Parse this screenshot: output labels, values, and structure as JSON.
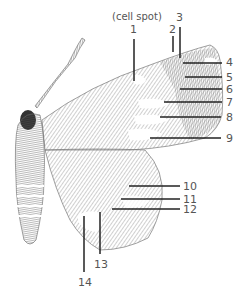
{
  "diagram": {
    "header_note": "(cell spot)",
    "labels": [
      {
        "id": "1",
        "text": "1"
      },
      {
        "id": "2",
        "text": "2"
      },
      {
        "id": "3",
        "text": "3"
      },
      {
        "id": "4",
        "text": "4"
      },
      {
        "id": "5",
        "text": "5"
      },
      {
        "id": "6",
        "text": "6"
      },
      {
        "id": "7",
        "text": "7"
      },
      {
        "id": "8",
        "text": "8"
      },
      {
        "id": "9",
        "text": "9"
      },
      {
        "id": "10",
        "text": "10"
      },
      {
        "id": "11",
        "text": "11"
      },
      {
        "id": "12",
        "text": "12"
      },
      {
        "id": "13",
        "text": "13"
      },
      {
        "id": "14",
        "text": "14"
      }
    ],
    "colors": {
      "ink": "#222222",
      "hatch": "#8a8a8a",
      "label": "#555555",
      "background": "#ffffff"
    }
  }
}
